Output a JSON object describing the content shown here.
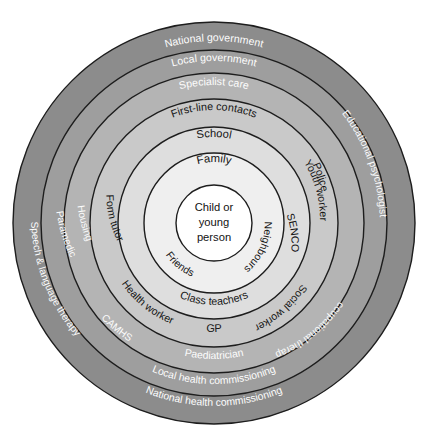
{
  "diagram": {
    "center_x": 214,
    "center_y": 223,
    "geometry_note": "concentric circles centred at (214,223), outer radius 201",
    "colors": {
      "ring_national_health": "#8c8c8c",
      "ring_local_health": "#9e9e9e",
      "ring_specialist": "#b4b4b4",
      "ring_first_line": "#c9c9c9",
      "ring_school": "#dedede",
      "ring_family": "#efefef",
      "ring_core": "#ffffff",
      "outline": "#1d1d1d",
      "text_light": "#fdfdfd",
      "text_dark": "#141414",
      "background": "#ffffff"
    },
    "core": {
      "name": "child-or-young-person",
      "lines": [
        "Child or",
        "young",
        "person"
      ],
      "radius": 38
    },
    "rings": [
      {
        "id": "family",
        "top_label": "Family",
        "radius": 70,
        "fill": "#efefef",
        "label_style": "dark",
        "spokes": [
          "Friends",
          "Neighbours"
        ]
      },
      {
        "id": "school",
        "top_label": "School",
        "radius": 96,
        "fill": "#dedede",
        "label_style": "dark",
        "spokes": [
          "Form tutor",
          "Class teachers",
          "SENCO"
        ]
      },
      {
        "id": "first-line-contacts",
        "top_label": "First-line contacts",
        "radius": 124,
        "fill": "#c9c9c9",
        "label_style": "dark",
        "spokes": [
          "Health worker",
          "GP",
          "Social worker",
          "Youth worker",
          "Police"
        ]
      },
      {
        "id": "specialist-care",
        "top_label": "Specialist care",
        "radius": 150,
        "fill": "#b4b4b4",
        "label_style": "light",
        "spokes": [
          "Housing",
          "CAMHS",
          "Paediatrician",
          "Occupational therapy",
          "Educational psychologist"
        ]
      },
      {
        "id": "local-government",
        "top_label": "Local government",
        "radius": 173,
        "fill": "#9e9e9e",
        "label_style": "light",
        "spokes": [
          "Paramedic",
          "Local health commissioning"
        ]
      },
      {
        "id": "national-government",
        "top_label": "National government",
        "radius": 201,
        "fill": "#8c8c8c",
        "label_style": "light",
        "spokes": [
          "Speech & language therapy",
          "National health commissioning"
        ]
      }
    ],
    "all_labels": [
      "National government",
      "Local government",
      "Specialist care",
      "First-line contacts",
      "School",
      "Family",
      "Child or young person",
      "Friends",
      "Neighbours",
      "Form tutor",
      "Class teachers",
      "SENCO",
      "Health worker",
      "GP",
      "Social worker",
      "Youth worker",
      "Police",
      "Housing",
      "CAMHS",
      "Paediatrician",
      "Occupational therapy",
      "Educational psychologist",
      "Paramedic",
      "Local health commissioning",
      "Speech & language therapy",
      "National health commissioning"
    ]
  }
}
